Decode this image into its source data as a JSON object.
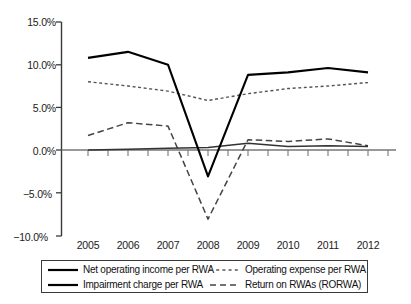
{
  "chart_data": {
    "type": "line",
    "title": "",
    "subtitle": "",
    "xlabel": "",
    "ylabel": "",
    "categories": [
      "2005",
      "2006",
      "2007",
      "2008",
      "2009",
      "2010",
      "2011",
      "2012"
    ],
    "x": [
      2005,
      2006,
      2007,
      2008,
      2009,
      2010,
      2011,
      2012
    ],
    "ylim": [
      -10.0,
      15.0
    ],
    "ytick_values": [
      15.0,
      10.0,
      5.0,
      0.0,
      -5.0,
      -10.0
    ],
    "ytick_labels": [
      "15.0%",
      "10.0%",
      "5.0%",
      "0.0%",
      "−5.0%",
      "−10.0%"
    ],
    "grid": false,
    "legend_position": "bottom",
    "zero_line": true,
    "series": [
      {
        "name": "Net operating income per RWA",
        "style": "solid",
        "width": 2.0,
        "color": "#000000",
        "values": [
          10.8,
          11.5,
          10.0,
          -3.1,
          8.8,
          9.1,
          9.6,
          9.1
        ]
      },
      {
        "name": "Operating expense per RWA",
        "style": "dotted",
        "width": 1.3,
        "color": "#555555",
        "values": [
          8.0,
          7.5,
          6.9,
          5.8,
          6.6,
          7.2,
          7.5,
          7.9
        ]
      },
      {
        "name": "Impairment charge per RWA",
        "style": "solid",
        "width": 1.3,
        "color": "#333333",
        "values": [
          0.0,
          0.1,
          0.2,
          0.3,
          0.8,
          0.4,
          0.5,
          0.4
        ]
      },
      {
        "name": "Return on RWAs (RORWA)",
        "style": "dashed",
        "width": 1.5,
        "color": "#444444",
        "values": [
          1.7,
          3.2,
          2.8,
          -8.1,
          1.2,
          1.0,
          1.3,
          0.5
        ]
      }
    ]
  },
  "axes": {
    "y_labels": [
      "15.0%",
      "10.0%",
      "5.0%",
      "0.0%",
      "−5.0%",
      "−10.0%"
    ],
    "x_labels": [
      "2005",
      "2006",
      "2007",
      "2008",
      "2009",
      "2010",
      "2011",
      "2012"
    ]
  },
  "legend": {
    "entries": [
      {
        "label": "Net operating income per RWA",
        "style": "solid-thick"
      },
      {
        "label": "Operating expense per RWA",
        "style": "dotted"
      },
      {
        "label": "Impairment charge per RWA",
        "style": "solid-thick"
      },
      {
        "label": "Return on RWAs (RORWA)",
        "style": "dashed"
      }
    ]
  }
}
